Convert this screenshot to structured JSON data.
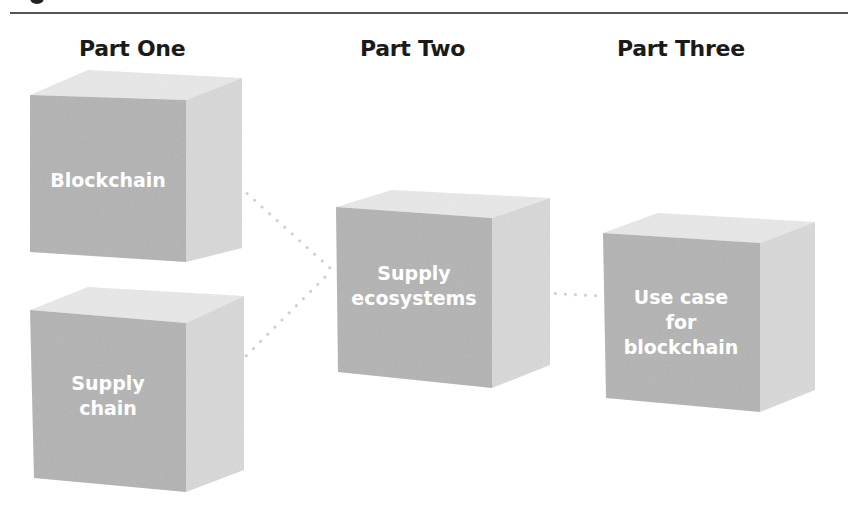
{
  "diagram": {
    "columns": [
      {
        "title": "Part One"
      },
      {
        "title": "Part Two"
      },
      {
        "title": "Part Three"
      }
    ],
    "cubes": [
      {
        "id": "blockchain",
        "label": "Blockchain",
        "column": "Part One"
      },
      {
        "id": "supply-chain",
        "label": "Supply chain",
        "label_lines": [
          "Supply",
          "chain"
        ],
        "column": "Part One"
      },
      {
        "id": "supply-ecosystems",
        "label": "Supply ecosystems",
        "label_lines": [
          "Supply",
          "ecosystems"
        ],
        "column": "Part Two"
      },
      {
        "id": "use-case",
        "label": "Use case for blockchain",
        "label_lines": [
          "Use case",
          "for",
          "blockchain"
        ],
        "column": "Part Three"
      }
    ],
    "connections": [
      {
        "from": "blockchain",
        "to": "supply-ecosystems",
        "style": "dotted"
      },
      {
        "from": "supply-chain",
        "to": "supply-ecosystems",
        "style": "dotted"
      },
      {
        "from": "supply-ecosystems",
        "to": "use-case",
        "style": "dotted"
      }
    ],
    "colors": {
      "front_face": "#b3b3b3",
      "side_face": "#d9d9d9",
      "top_face": "#e9e9e9",
      "label": "#ffffff",
      "title": "#1a1a1a",
      "connector": "#cfcfcf"
    }
  }
}
